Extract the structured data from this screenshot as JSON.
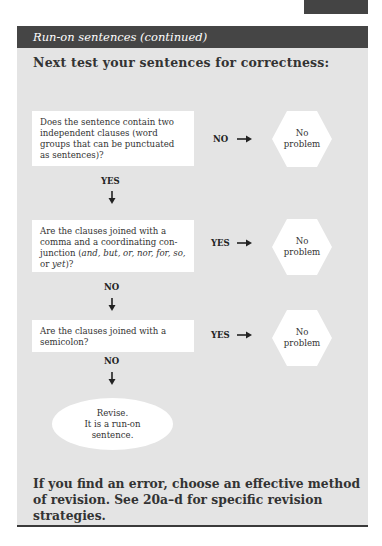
{
  "header": {
    "title": "Run-on sentences",
    "title_suffix": "(continued)"
  },
  "heading": "Next test your sentences for correctness:",
  "flowchart": {
    "steps": [
      {
        "question": "Does the sentence contain two independent clauses (word groups that can be punctuated as sentences)?",
        "side_label": "NO",
        "side_result": [
          "No",
          "problem"
        ],
        "down_label": "YES"
      },
      {
        "question_parts": [
          "Are the clauses joined with a comma and a coordinating con-junction (",
          "and, but, or, nor, for, so,",
          " or ",
          "yet",
          ")?"
        ],
        "side_label": "YES",
        "side_result": [
          "No",
          "problem"
        ],
        "down_label": "NO"
      },
      {
        "question": "Are the clauses joined with a semicolon?",
        "side_label": "YES",
        "side_result": [
          "No",
          "problem"
        ],
        "down_label": "NO"
      }
    ],
    "final": [
      "Revise.",
      "It is a run-on",
      "sentence."
    ]
  },
  "footer": "If you find an error, choose an effective method of revision. See 20a–d for specific revision strategies.",
  "colors": {
    "panel": "#e4e4e4",
    "header_bar": "#454545",
    "box": "#ffffff"
  }
}
